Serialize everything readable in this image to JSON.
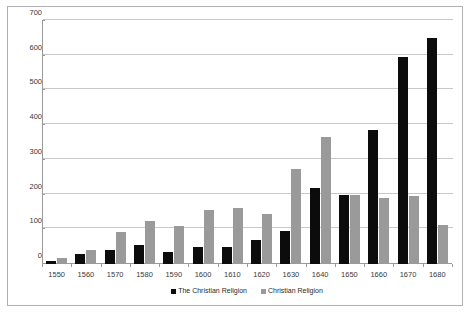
{
  "chart_data": {
    "type": "bar",
    "title": "",
    "subtitle": "",
    "xlabel": "",
    "ylabel": "",
    "categories": [
      "1550",
      "1560",
      "1570",
      "1580",
      "1590",
      "1600",
      "1610",
      "1620",
      "1630",
      "1640",
      "1650",
      "1660",
      "1670",
      "1680"
    ],
    "series": [
      {
        "name": "The Christian Religion",
        "color": "#0c0c0c",
        "values": [
          10,
          28,
          40,
          55,
          35,
          48,
          50,
          70,
          95,
          220,
          200,
          385,
          595,
          650
        ]
      },
      {
        "name": "Christian Religion",
        "color": "#9a9a9a",
        "values": [
          17,
          40,
          93,
          125,
          110,
          155,
          160,
          145,
          275,
          365,
          200,
          190,
          195,
          112
        ]
      }
    ],
    "ylim": [
      0,
      700
    ],
    "yticks": [
      0,
      100,
      200,
      300,
      400,
      500,
      600,
      700
    ],
    "ytick_labels": [
      "0",
      "100",
      "200",
      "300",
      "400",
      "500",
      "600",
      "700"
    ],
    "grid": true,
    "grid_axis": "y",
    "legend_position": "bottom",
    "legend": [
      "The Christian Religion",
      "Christian Religion"
    ],
    "colors": {
      "series_a": "#0c0c0c",
      "series_b": "#9a9a9a",
      "gridline": "#c8c8c8",
      "axis": "#9a9a9a",
      "border": "#b0b0b0",
      "background": "#ffffff",
      "text": "#3a3a3a"
    }
  }
}
